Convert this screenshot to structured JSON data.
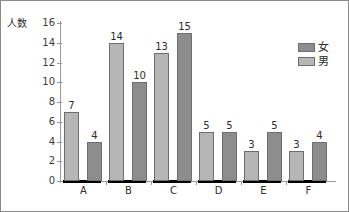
{
  "chart_data": {
    "type": "bar",
    "title": "",
    "subtitle": "",
    "xlabel": "",
    "ylabel": "人数",
    "ylim": [
      0,
      16
    ],
    "y_ticks": [
      0,
      2,
      4,
      6,
      8,
      10,
      12,
      14,
      16
    ],
    "grid": false,
    "legend_position": "top-right",
    "categories": [
      "A",
      "B",
      "C",
      "D",
      "E",
      "F"
    ],
    "series": [
      {
        "name": "男",
        "color": "#b6b6b6",
        "values": [
          7,
          14,
          13,
          5,
          3,
          3
        ]
      },
      {
        "name": "女",
        "color": "#8d8d8d",
        "values": [
          4,
          10,
          15,
          5,
          5,
          4
        ]
      }
    ],
    "data_labels": [
      [
        "7",
        "4"
      ],
      [
        "14",
        "10"
      ],
      [
        "13",
        "15"
      ],
      [
        "5",
        "5"
      ],
      [
        "3",
        "5"
      ],
      [
        "3",
        "4"
      ]
    ]
  },
  "axis": {
    "y_title": "人数",
    "y_tick_labels": [
      "16",
      "14",
      "12",
      "10",
      "8",
      "6",
      "4",
      "2",
      "0"
    ],
    "x_tick_labels": [
      "A",
      "B",
      "C",
      "D",
      "E",
      "F"
    ]
  },
  "legend": {
    "entries": [
      {
        "label": "女",
        "swatch": "female-swatch"
      },
      {
        "label": "男",
        "swatch": "male-swatch"
      }
    ]
  }
}
